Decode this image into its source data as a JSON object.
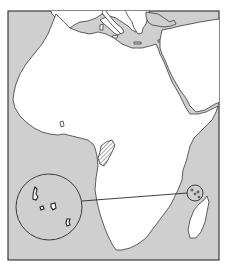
{
  "map": {
    "title": "",
    "subject": "Africa locator map",
    "highlighted_country": "Comoros",
    "inset": {
      "shape": "circle",
      "content": "Comoros islands (enlarged)",
      "islands": [
        "Grande Comore",
        "Mohéli",
        "Anjouan",
        "Mayotte"
      ]
    },
    "hatched_region": "Equatorial Guinea / Gabon area",
    "colors": {
      "sea": "#cfcfcf",
      "africa": "#ffffff",
      "other_land": "#cfcfcf",
      "outline": "#3a3a3a"
    }
  }
}
